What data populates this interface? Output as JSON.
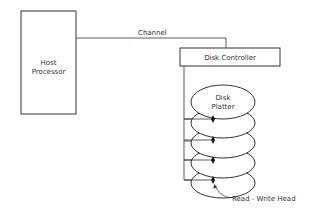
{
  "diagram": {
    "host": {
      "line1": "Host",
      "line2": "Processor"
    },
    "channel_label": "Channel",
    "controller_label": "Disk Controller",
    "platter": {
      "line1": "Disk",
      "line2": "Platter"
    },
    "head_label": "Read - Write  Head",
    "platter_count": 5,
    "colors": {
      "stroke": "#333333",
      "background": "#ffffff"
    }
  }
}
